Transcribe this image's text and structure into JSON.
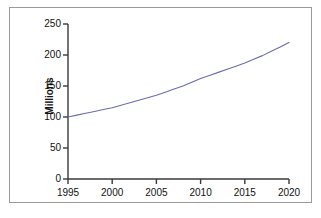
{
  "chart_data": {
    "type": "line",
    "title": "",
    "subtitle": "",
    "xlabel": "",
    "ylabel": "Millions",
    "xlim": [
      1995,
      2020
    ],
    "ylim": [
      0,
      250
    ],
    "grid": false,
    "legend": false,
    "line_color": "#6b6bb3",
    "axis_color": "#3a3a3a",
    "frame_color": "#9a9a9a",
    "x_ticks": [
      "1995",
      "2000",
      "2005",
      "2010",
      "2015",
      "2020"
    ],
    "y_ticks": [
      "0",
      "50",
      "100",
      "150",
      "200",
      "250"
    ],
    "x": [
      1995,
      1996,
      1997,
      1998,
      1999,
      2000,
      2001,
      2002,
      2003,
      2004,
      2005,
      2006,
      2007,
      2008,
      2009,
      2010,
      2011,
      2012,
      2013,
      2014,
      2015,
      2016,
      2017,
      2018,
      2019,
      2020
    ],
    "series": [
      {
        "name": "Millions",
        "values": [
          100,
          103,
          106,
          109,
          112,
          115,
          119,
          123,
          127,
          131,
          135,
          140,
          145,
          150,
          156,
          162,
          167,
          172,
          177,
          182,
          187,
          193,
          199,
          206,
          213,
          220
        ]
      }
    ],
    "annotations": []
  }
}
